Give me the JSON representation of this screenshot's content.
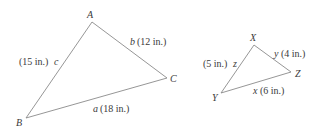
{
  "figure": {
    "triangles": [
      {
        "name": "ABC",
        "vertices": [
          {
            "label": "A",
            "x": 92,
            "y": 22
          },
          {
            "label": "B",
            "x": 26,
            "y": 118
          },
          {
            "label": "C",
            "x": 167,
            "y": 78
          }
        ],
        "sides": [
          {
            "letter": "c",
            "length": "(15 in.)",
            "between": "A-B"
          },
          {
            "letter": "b",
            "length": "(12 in.)",
            "between": "A-C"
          },
          {
            "letter": "a",
            "length": "(18 in.)",
            "between": "B-C"
          }
        ]
      },
      {
        "name": "XYZ",
        "vertices": [
          {
            "label": "X",
            "x": 254,
            "y": 45
          },
          {
            "label": "Y",
            "x": 221,
            "y": 93
          },
          {
            "label": "Z",
            "x": 291,
            "y": 72
          }
        ],
        "sides": [
          {
            "letter": "z",
            "length": "(5 in.)",
            "between": "X-Y"
          },
          {
            "letter": "y",
            "length": "(4 in.)",
            "between": "X-Z"
          },
          {
            "letter": "x",
            "length": "(6 in.)",
            "between": "Y-Z"
          }
        ]
      }
    ]
  }
}
